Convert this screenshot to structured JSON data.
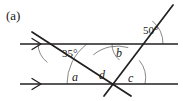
{
  "figure": {
    "part_label": "(a)",
    "width": 183,
    "height": 101,
    "background_color": "#ffffff",
    "stroke_color": "#221f1f",
    "arc_color": "#6b6b6b",
    "text_color": "#1a1a1a"
  },
  "lines": {
    "parallel_upper": {
      "name": "upper parallel line",
      "y": 44,
      "x_start": 20,
      "x_end": 178,
      "arrow_marker": ">",
      "arrow_x": 38
    },
    "parallel_lower": {
      "name": "lower parallel line",
      "y": 84,
      "x_start": 20,
      "x_end": 178,
      "arrow_marker": ">",
      "arrow_x": 38
    },
    "transversal_left": {
      "name": "transversal falling left to right",
      "x1": 32,
      "y1": 32,
      "x2": 131,
      "y2": 96
    },
    "transversal_right": {
      "name": "transversal rising left to right",
      "x1": 104,
      "y1": 96,
      "x2": 173,
      "y2": 5
    }
  },
  "intersections": {
    "upper_left": {
      "x": 62,
      "y": 44
    },
    "upper_right": {
      "x": 133,
      "y": 44
    },
    "lower_center": {
      "x": 117,
      "y": 84
    }
  },
  "angles": [
    {
      "id": "angle-35",
      "label": "35°",
      "value": 35,
      "unit": "degrees",
      "label_x": 62,
      "label_y": 47,
      "position": "below upper parallel line, right of left transversal"
    },
    {
      "id": "angle-50",
      "label": "50°",
      "value": 50,
      "unit": "degrees",
      "label_x": 143,
      "label_y": 24,
      "position": "above upper parallel line, right of right transversal"
    },
    {
      "id": "angle-b",
      "label": "b",
      "value": null,
      "unit": "unknown",
      "label_x": 116,
      "label_y": 46,
      "position": "below upper parallel line, left of right transversal"
    },
    {
      "id": "angle-a",
      "label": "a",
      "value": null,
      "unit": "unknown",
      "label_x": 72,
      "label_y": 70,
      "position": "above lower parallel line, left of left transversal"
    },
    {
      "id": "angle-d",
      "label": "d",
      "value": null,
      "unit": "unknown",
      "label_x": 99,
      "label_y": 68,
      "position": "between the two transversals above lower intersection"
    },
    {
      "id": "angle-c",
      "label": "c",
      "value": null,
      "unit": "unknown",
      "label_x": 128,
      "label_y": 71,
      "position": "above lower parallel line, right of right transversal"
    }
  ]
}
